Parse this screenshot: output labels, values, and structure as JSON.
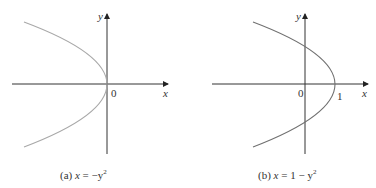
{
  "panels": [
    {
      "id": "a",
      "caption_prefix": "(a) ",
      "caption_eq_lhs": "x",
      "caption_eq_rhs": " = −y",
      "caption_exp": "2",
      "axis_x_label": "x",
      "axis_y_label": "y",
      "origin_label": "0",
      "curve_color": "#a8a8a8",
      "equation": "x = -y^2"
    },
    {
      "id": "b",
      "caption_prefix": "(b) ",
      "caption_eq_lhs": "x",
      "caption_eq_rhs": " = 1 − y",
      "caption_exp": "2",
      "axis_x_label": "x",
      "axis_y_label": "y",
      "origin_label": "0",
      "vertex_label": "1",
      "curve_color": "#707070",
      "equation": "x = 1 - y^2"
    }
  ]
}
